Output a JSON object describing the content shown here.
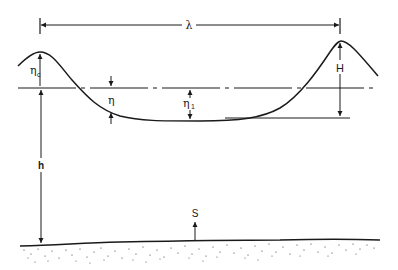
{
  "diagram": {
    "type": "wave-profile-definition-sketch",
    "labels": {
      "wavelength": "λ",
      "crest_elevation": "η",
      "crest_elevation_sub": "c",
      "surface_elevation": "η",
      "trough_elevation": "η",
      "trough_elevation_sub": "1",
      "wave_height": "H",
      "water_depth": "h",
      "seabed": "S"
    },
    "elements": [
      "wave surface profile",
      "still water level (dash-dot line)",
      "wavelength dimension arrow",
      "wave height dimension",
      "water depth dimension",
      "seabed with stippled sediment"
    ],
    "colors": {
      "ink": "#1a1a1a",
      "background": "#ffffff"
    }
  }
}
